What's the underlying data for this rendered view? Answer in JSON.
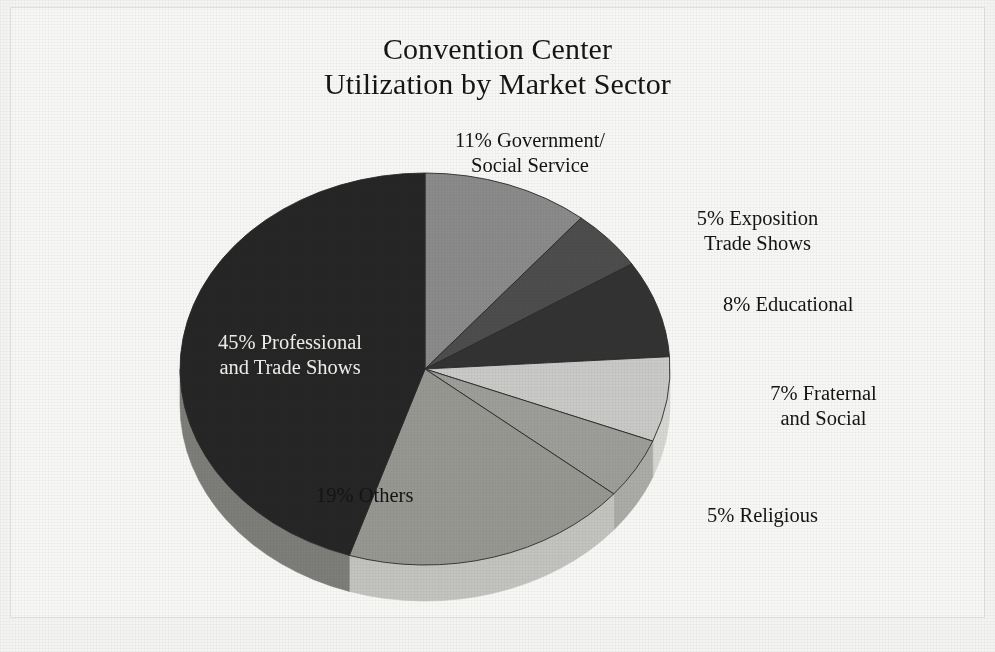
{
  "chart_data": {
    "type": "pie",
    "title": "Convention Center\nUtilization by Market Sector",
    "title_line1": "Convention Center",
    "title_line2": "Utilization by Market Sector",
    "xlabel": "",
    "ylabel": "",
    "legend": "none (labels placed around slices)",
    "grid": false,
    "three_d": true,
    "units": "percent",
    "total": 100,
    "categories": [
      "Government/Social Service",
      "Exposition Trade Shows",
      "Educational",
      "Fraternal and Social",
      "Religious",
      "Others",
      "Professional and Trade Shows"
    ],
    "values": [
      11,
      5,
      8,
      7,
      5,
      19,
      45
    ],
    "slices": [
      {
        "name": "Government/Social Service",
        "value": 11,
        "label": "11% Government/\nSocial Service",
        "color": "#8a8a8a",
        "side_color": "#9a9a9a"
      },
      {
        "name": "Exposition Trade Shows",
        "value": 5,
        "label": "5% Exposition\nTrade Shows",
        "color": "#4d4d4d",
        "side_color": "#5d5d5d"
      },
      {
        "name": "Educational",
        "value": 8,
        "label": "8% Educational",
        "color": "#333333",
        "side_color": "#434343"
      },
      {
        "name": "Fraternal and Social",
        "value": 7,
        "label": "7% Fraternal\nand Social",
        "color": "#c9c9c7",
        "side_color": "#d6d6d3"
      },
      {
        "name": "Religious",
        "value": 5,
        "label": "5% Religious",
        "color": "#9d9d9a",
        "side_color": "#ababa8"
      },
      {
        "name": "Others",
        "value": 19,
        "label": "19% Others",
        "color": "#979792",
        "side_color": "#c3c3bf"
      },
      {
        "name": "Professional and Trade Shows",
        "value": 45,
        "label": "45% Professional\nand Trade Shows",
        "color": "#262626",
        "side_color": "#7d7d7a"
      }
    ],
    "background_color": "#f4f4f2",
    "text_color": "#141414",
    "dark_slice_text_color": "#f0efea"
  }
}
